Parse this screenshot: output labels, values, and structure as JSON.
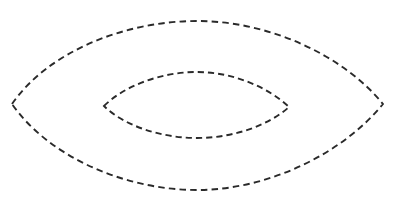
{
  "canvas": {
    "width": 407,
    "height": 207,
    "background_color": "#ffffff"
  },
  "figure": {
    "name": "concentric-dashed-lens-outlines",
    "shape_count": 2,
    "stroke_color": "#2a2a2a",
    "stroke_width": 1.9,
    "dash_length": 6.5,
    "dash_gap": 4.2,
    "fill": "none"
  },
  "chart_data": {
    "type": "line",
    "title": "",
    "subtitle": "",
    "xlabel": "",
    "ylabel": "",
    "xlim": [
      0,
      407
    ],
    "ylim": [
      207,
      0
    ],
    "grid": false,
    "legend": false,
    "legend_position": "none",
    "annotations": [],
    "tick_labels": {
      "x": [],
      "y": []
    },
    "series": [
      {
        "name": "outer-lens",
        "closed": true,
        "style": "dashed",
        "color": "#2a2a2a",
        "stroke_width": 1.9,
        "dash_length": 6.5,
        "dash_gap": 4.2,
        "left_vertex": [
          12,
          104
        ],
        "right_vertex": [
          383,
          104
        ],
        "top_apex": [
          197,
          21
        ],
        "bottom_apex": [
          197,
          190
        ],
        "width": 371,
        "height": 169,
        "path": "M 12 104 C 48 52, 124 21, 197 21 C 270 21, 344 56, 383 104 C 344 152, 270 190, 197 190 C 124 190, 48 156, 12 104 Z"
      },
      {
        "name": "inner-lens",
        "closed": true,
        "style": "dashed",
        "color": "#2a2a2a",
        "stroke_width": 1.9,
        "dash_length": 6.2,
        "dash_gap": 4.0,
        "left_vertex": [
          104,
          106
        ],
        "right_vertex": [
          289,
          107
        ],
        "top_apex": [
          197,
          72
        ],
        "bottom_apex": [
          197,
          138
        ],
        "width": 185,
        "height": 66,
        "path": "M 104 106 C 124 86, 161 72, 197 72 C 234 72, 269 88, 289 107 C 269 125, 234 138, 197 138 C 160 138, 123 125, 104 106 Z"
      }
    ]
  }
}
